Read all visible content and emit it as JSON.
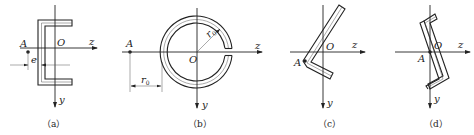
{
  "figure": {
    "panels": [
      {
        "id": "a",
        "caption": "（a）",
        "shape": "channel-section",
        "labels": {
          "point": "A",
          "origin": "O",
          "z_axis": "z",
          "y_axis": "y",
          "dimension": "e"
        }
      },
      {
        "id": "b",
        "caption": "（b）",
        "shape": "split-ring-section",
        "labels": {
          "point": "A",
          "origin": "O",
          "z_axis": "z",
          "y_axis": "y",
          "radius": "r0",
          "dimension": "r0"
        }
      },
      {
        "id": "c",
        "caption": "（c）",
        "shape": "angle-section",
        "labels": {
          "point": "A",
          "origin": "O",
          "z_axis": "z",
          "y_axis": "y"
        }
      },
      {
        "id": "d",
        "caption": "（d）",
        "shape": "z-section",
        "labels": {
          "point": "A",
          "origin": "O",
          "z_axis": "z",
          "y_axis": "y"
        }
      }
    ]
  }
}
